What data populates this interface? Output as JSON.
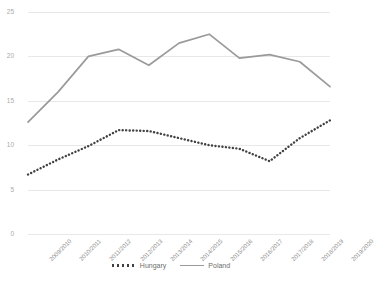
{
  "chart_data": {
    "type": "line",
    "title": "",
    "subtitle": "",
    "xlabel": "",
    "ylabel": "",
    "ylim": [
      0,
      25
    ],
    "yticks": [
      0,
      5,
      10,
      15,
      20,
      25
    ],
    "grid": true,
    "legend_position": "bottom",
    "categories": [
      "2009/2010",
      "2010/2011",
      "2011/2012",
      "2012/2013",
      "2013/2014",
      "2014/2015",
      "2015/2016",
      "2016/2017",
      "2017/2018",
      "2018/2019",
      "2019/2020"
    ],
    "series": [
      {
        "name": "Hungary",
        "style": "dotted",
        "color": "#404040",
        "values": [
          6.7,
          8.4,
          9.9,
          11.7,
          11.6,
          10.8,
          10.0,
          9.6,
          8.2,
          10.8,
          12.8
        ]
      },
      {
        "name": "Poland",
        "style": "solid",
        "color": "#9a9a9a",
        "values": [
          12.6,
          16.0,
          20.0,
          20.8,
          19.0,
          21.5,
          22.5,
          19.8,
          20.2,
          19.4,
          16.6
        ]
      }
    ]
  },
  "axis": {
    "y_tick_color": "#aaaaaa",
    "x_tick_color": "#8e8e8e",
    "gridline_color": "#e8e8e8"
  },
  "legend": {
    "items": [
      {
        "label": "Hungary",
        "color": "#404040",
        "style": "dotted"
      },
      {
        "label": "Poland",
        "color": "#9a9a9a",
        "style": "solid"
      }
    ]
  }
}
